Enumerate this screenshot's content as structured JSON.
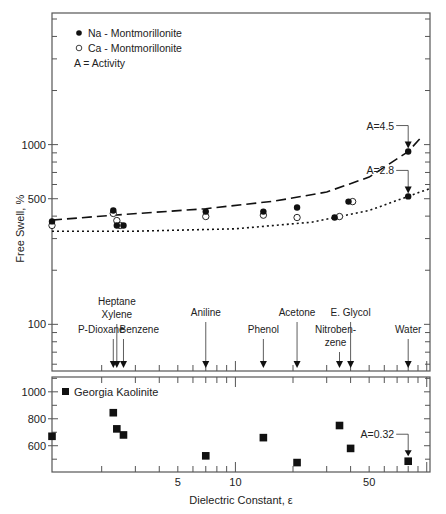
{
  "chart_data": [
    {
      "type": "scatter",
      "panel": "top",
      "xlabel": "",
      "ylabel": "Free Swell, %",
      "yscale": "log",
      "xscale": "log",
      "ylim": [
        55,
        5400
      ],
      "xlim": [
        1.1,
        104
      ],
      "yticks": [
        100,
        500,
        1000
      ],
      "ytick_labels": [
        "100",
        "500",
        "1000"
      ],
      "legend": {
        "placement": "top-left",
        "entries": [
          {
            "marker": "filled-circle",
            "label": "Na - Montmorillonite"
          },
          {
            "marker": "open-circle",
            "label": "Ca - Montmorillonite"
          },
          {
            "marker": "none",
            "label": "A = Activity"
          }
        ]
      },
      "series": [
        {
          "name": "Na - Montmorillonite",
          "marker": "filled-circle",
          "points": [
            {
              "x": 1.1,
              "y": 374
            },
            {
              "x": 2.3,
              "y": 430
            },
            {
              "x": 2.4,
              "y": 355
            },
            {
              "x": 2.6,
              "y": 355
            },
            {
              "x": 7.0,
              "y": 424
            },
            {
              "x": 14,
              "y": 424
            },
            {
              "x": 21,
              "y": 447
            },
            {
              "x": 33,
              "y": 393
            },
            {
              "x": 39,
              "y": 482
            },
            {
              "x": 80,
              "y": 915
            },
            {
              "x": 80,
              "y": 515
            }
          ]
        },
        {
          "name": "Ca - Montmorillonite",
          "marker": "open-circle",
          "points": [
            {
              "x": 1.1,
              "y": 355
            },
            {
              "x": 2.3,
              "y": 414
            },
            {
              "x": 2.4,
              "y": 378
            },
            {
              "x": 2.5,
              "y": 355
            },
            {
              "x": 7.0,
              "y": 398
            },
            {
              "x": 14,
              "y": 405
            },
            {
              "x": 21,
              "y": 393
            },
            {
              "x": 35,
              "y": 398
            },
            {
              "x": 41,
              "y": 482
            }
          ]
        },
        {
          "name": "A=4.5 trend",
          "style": "dashed",
          "points": [
            {
              "x": 1.1,
              "y": 380
            },
            {
              "x": 2.3,
              "y": 405
            },
            {
              "x": 7,
              "y": 440
            },
            {
              "x": 16,
              "y": 485
            },
            {
              "x": 30,
              "y": 545
            },
            {
              "x": 50,
              "y": 660
            },
            {
              "x": 80,
              "y": 915
            },
            {
              "x": 95,
              "y": 1120
            }
          ]
        },
        {
          "name": "A=2.8 trend",
          "style": "dotted",
          "points": [
            {
              "x": 1.1,
              "y": 330
            },
            {
              "x": 3,
              "y": 330
            },
            {
              "x": 10,
              "y": 340
            },
            {
              "x": 25,
              "y": 370
            },
            {
              "x": 50,
              "y": 430
            },
            {
              "x": 80,
              "y": 515
            },
            {
              "x": 104,
              "y": 570
            }
          ]
        }
      ],
      "annotations": [
        {
          "text": "A=4.5",
          "x": 80,
          "y": 915
        },
        {
          "text": "A=2.8",
          "x": 80,
          "y": 515
        }
      ],
      "solvents": [
        {
          "name": "P-Dioxane",
          "x": 2.3
        },
        {
          "name": "Heptane Xylene",
          "lines": [
            "Heptane",
            "Xylene"
          ],
          "x": 2.4
        },
        {
          "name": "Benzene",
          "x": 2.6
        },
        {
          "name": "Aniline",
          "x": 7.0
        },
        {
          "name": "Phenol",
          "x": 14
        },
        {
          "name": "Acetone",
          "x": 21
        },
        {
          "name": "Nitrobenzene",
          "lines": [
            "Nitroben-",
            "zene"
          ],
          "x": 35
        },
        {
          "name": "E. Glycol",
          "x": 40
        },
        {
          "name": "Water",
          "x": 80
        }
      ]
    },
    {
      "type": "scatter",
      "panel": "bottom",
      "xlabel": "Dielectric Constant, ε",
      "ylabel": "",
      "xscale": "log",
      "yscale": "linear",
      "xlim": [
        1.1,
        104
      ],
      "ylim": [
        405,
        1110
      ],
      "xticks": [
        5,
        10,
        50
      ],
      "xtick_labels": [
        "5",
        "10",
        "50"
      ],
      "yticks": [
        600,
        800,
        1000
      ],
      "ytick_labels": [
        "600",
        "800",
        "1000"
      ],
      "legend": {
        "placement": "top-left",
        "entries": [
          {
            "marker": "filled-square",
            "label": "Georgia Kaolinite"
          }
        ]
      },
      "series": [
        {
          "name": "Georgia Kaolinite",
          "marker": "filled-square",
          "points": [
            {
              "x": 1.1,
              "y": 670
            },
            {
              "x": 2.3,
              "y": 845
            },
            {
              "x": 2.4,
              "y": 725
            },
            {
              "x": 2.6,
              "y": 680
            },
            {
              "x": 7.0,
              "y": 525
            },
            {
              "x": 14,
              "y": 660
            },
            {
              "x": 21,
              "y": 475
            },
            {
              "x": 35,
              "y": 750
            },
            {
              "x": 40,
              "y": 580
            },
            {
              "x": 80,
              "y": 485
            }
          ]
        }
      ],
      "annotations": [
        {
          "text": "A=0.32",
          "x": 80,
          "y": 485
        }
      ]
    }
  ]
}
